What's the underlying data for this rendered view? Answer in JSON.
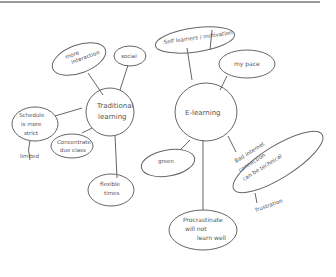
{
  "diagram": {
    "type": "mind-map",
    "style": "hand-drawn pencil on paper",
    "central_nodes": [
      {
        "id": "traditional",
        "label_lines": [
          "Traditional",
          "learning"
        ],
        "branches": [
          {
            "id": "more-interaction",
            "label_lines": [
              "more",
              "interaction"
            ]
          },
          {
            "id": "social",
            "label_lines": [
              "social"
            ]
          },
          {
            "id": "schedule",
            "label_lines": [
              "Schedule",
              "is more",
              "strict"
            ],
            "children": [
              {
                "id": "limited",
                "label_lines": [
                  "limited"
                ]
              }
            ]
          },
          {
            "id": "concentration",
            "label_lines": [
              "Concentrate",
              "due class"
            ]
          },
          {
            "id": "flexible-times",
            "label_lines": [
              "flexible",
              "times"
            ]
          }
        ]
      },
      {
        "id": "elearning",
        "label_lines": [
          "E-learning"
        ],
        "branches": [
          {
            "id": "self-learners",
            "label_lines": [
              "Self learners / motivation"
            ]
          },
          {
            "id": "my-pace",
            "label_lines": [
              "my pace"
            ]
          },
          {
            "id": "green",
            "label_lines": [
              "green"
            ]
          },
          {
            "id": "bad-internet",
            "label_lines": [
              "Bad internet",
              "connection",
              "can be technical"
            ],
            "children": [
              {
                "id": "frustration",
                "label_lines": [
                  "frustration"
                ]
              }
            ]
          },
          {
            "id": "procrastinate",
            "label_lines": [
              "Procrastinate",
              "will not",
              "learn well"
            ]
          }
        ]
      }
    ]
  }
}
